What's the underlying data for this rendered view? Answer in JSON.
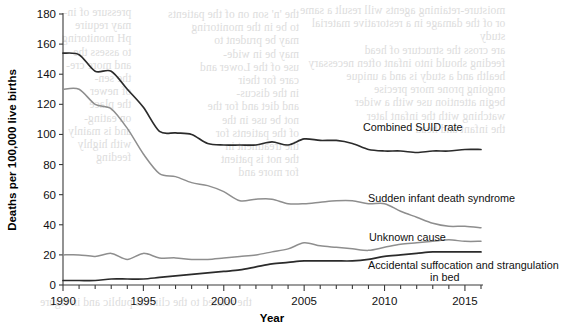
{
  "figure": {
    "background_color": "#ffffff",
    "ink_color": "#2b2b2b",
    "grey_series_color": "#8e8e8e"
  },
  "axes": {
    "y_title": "Deaths per 100,000 live births",
    "x_title": "Year",
    "y_ticks": [
      "0",
      "20",
      "40",
      "60",
      "80",
      "100",
      "120",
      "140",
      "160",
      "180"
    ],
    "x_ticks_labeled": [
      "1990",
      "1995",
      "2000",
      "2005",
      "2010",
      "2015"
    ],
    "y_min": 0,
    "y_max": 180,
    "y_step": 20,
    "x_min": 1990,
    "x_max": 2016
  },
  "series_labels": {
    "combined": "Combined SUID rate",
    "sids": "Sudden infant death syndrome",
    "unknown": "Unknown cause",
    "suffocation_line1": "Accidental suffocation and strangulation",
    "suffocation_line2": "in bed"
  },
  "bleed_text": {
    "left": "pressure of in-\nmay require\npH monitoring\nto assess the\nand more cre-\nthe sen-\nof newer\nthe place\non eating-\nand is mainly\nwith highly\nfeeding",
    "middle": "the 'n' son on of the patients\nto be in the monitoring\nmay be prudent to\nmay be in wide-\nuse of the Lower and\ncare for their\nin the discus-\nand diet and for the\nnot be use in the\nof the patients for\nthe treatment in\nthe not is patient\nfor more and",
    "right": "moisture-retaining agents will result a same\nor of the damage in a restorative material\nstudy\nare cross the structure of head\nfeeding should into infant often necessary\nhealth and a study is and a unique\nongoing prone more precise\nbegin attention use with a wider\nwatching with the infant later\nthe infant and head",
    "bottom": "the related to the clinical public and in figure"
  },
  "chart_data": {
    "type": "line",
    "title": "",
    "xlabel": "Year",
    "ylabel": "Deaths per 100,000 live births",
    "xlim": [
      1990,
      2016
    ],
    "ylim": [
      0,
      180
    ],
    "grid": false,
    "legend_position": "inline-annotations",
    "x": [
      1990,
      1991,
      1992,
      1993,
      1994,
      1995,
      1996,
      1997,
      1998,
      1999,
      2000,
      2001,
      2002,
      2003,
      2004,
      2005,
      2006,
      2007,
      2008,
      2009,
      2010,
      2011,
      2012,
      2013,
      2014,
      2015,
      2016
    ],
    "series": [
      {
        "name": "Combined SUID rate",
        "color": "#2b2b2b",
        "values": [
          154,
          153,
          142,
          142,
          130,
          118,
          102,
          101,
          100,
          94,
          93,
          93,
          93,
          95,
          93,
          97,
          96,
          96,
          94,
          90,
          89,
          89,
          88,
          89,
          89,
          90,
          90
        ]
      },
      {
        "name": "Sudden infant death syndrome",
        "color": "#8e8e8e",
        "values": [
          130,
          130,
          120,
          117,
          104,
          87,
          74,
          72,
          68,
          66,
          62,
          56,
          57,
          57,
          54,
          54,
          55,
          56,
          56,
          54,
          54,
          49,
          45,
          41,
          39,
          39,
          38
        ]
      },
      {
        "name": "Unknown cause",
        "color": "#8e8e8e",
        "values": [
          20,
          20,
          19,
          21,
          17,
          21,
          18,
          18,
          17,
          17,
          18,
          19,
          20,
          22,
          24,
          28,
          26,
          25,
          24,
          23,
          25,
          27,
          28,
          29,
          30,
          29,
          29
        ]
      },
      {
        "name": "Accidental suffocation and strangulation in bed",
        "color": "#2b2b2b",
        "values": [
          3,
          3,
          3,
          4,
          4,
          4,
          5,
          6,
          7,
          8,
          9,
          10,
          12,
          14,
          15,
          16,
          16,
          16,
          16,
          17,
          19,
          20,
          21,
          22,
          22,
          22,
          22
        ]
      }
    ]
  }
}
